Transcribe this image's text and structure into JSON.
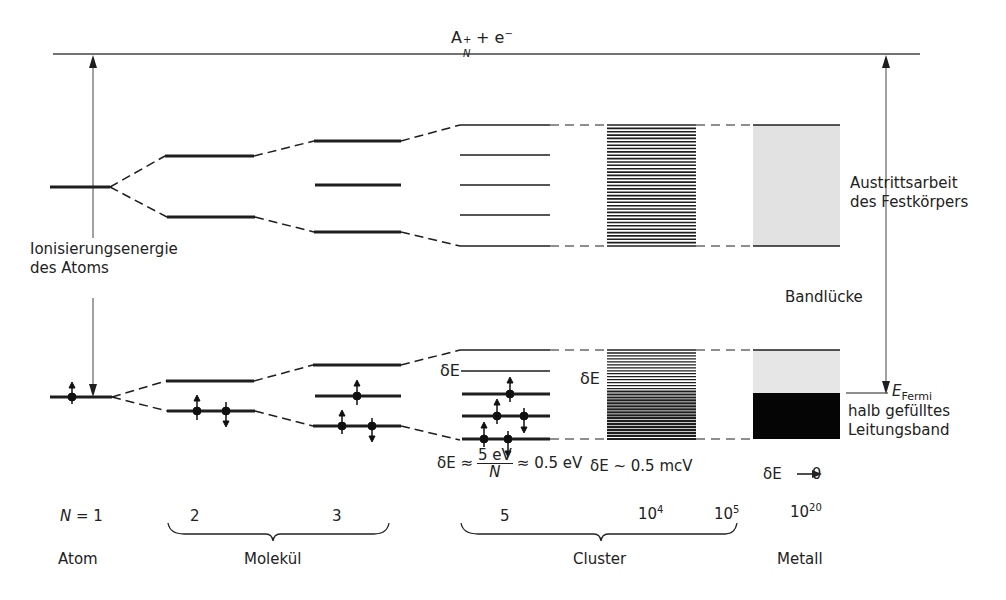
{
  "top_level": {
    "label_main": "A",
    "label_sup": "+",
    "label_sub": "N",
    "label_rest": " + e",
    "label_rest_sup": "−"
  },
  "left_arrow": {
    "line1": "Ionisierungsenergie",
    "line2": "des Atoms"
  },
  "right_arrow": {
    "line1": "Austrittsarbeit",
    "line2": "des Festkörpers"
  },
  "band_gap_label": "Bandlücke",
  "fermi": {
    "symbol": "E",
    "subscript": "Fermi",
    "line1": "halb gefülltes",
    "line2": "Leitungsband"
  },
  "delta_labels": {
    "cluster_small": "δE",
    "cluster_large": "δE",
    "cluster_formula_prefix": "δE ≈",
    "cluster_formula_num": "5 eV",
    "cluster_formula_den": "N",
    "cluster_formula_suffix": "≈ 0.5 eV",
    "cluster_large_formula": "δE ~ 0.5 mcV",
    "metal_formula_prefix": "δE",
    "metal_formula_arrow": "⟶",
    "metal_formula_value": "0"
  },
  "n_values": {
    "n_label": "N",
    "n1": "= 1",
    "n2": "2",
    "n3": "3",
    "n5": "5",
    "n1e4_base": "10",
    "n1e4_exp": "4",
    "n1e5_base": "10",
    "n1e5_exp": "5",
    "n1e20_base": "10",
    "n1e20_exp": "20"
  },
  "categories": {
    "atom": "Atom",
    "molecule": "Molekül",
    "cluster": "Cluster",
    "metal": "Metall"
  },
  "colors": {
    "line": "#1e1e1e",
    "metal_empty_band": "#e4e4e4",
    "metal_filled_band": "#050505",
    "thin_line": "#444444"
  }
}
